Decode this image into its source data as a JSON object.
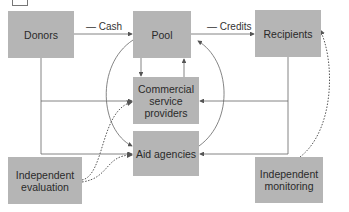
{
  "nodes": {
    "donors": "Donors",
    "pool": "Pool",
    "recipients": "Recipients",
    "commercial_line1": "Commercial",
    "commercial_line2": "service",
    "commercial_line3": "providers",
    "aid": "Aid agencies",
    "evaluation_line1": "Independent",
    "evaluation_line2": "evaluation",
    "monitoring_line1": "Independent",
    "monitoring_line2": "monitoring"
  },
  "edges": {
    "cash": "— Cash",
    "credits": "— Credits"
  },
  "colors": {
    "box_fill": "#b5b5b5",
    "line": "#555555"
  }
}
